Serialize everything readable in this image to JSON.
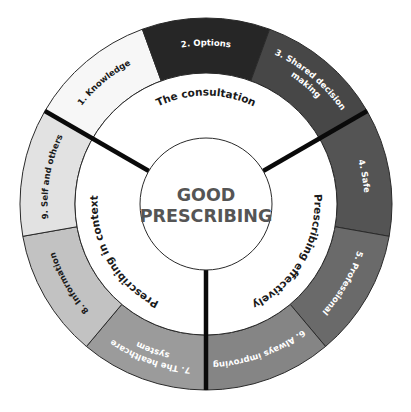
{
  "diagram": {
    "title": "GOOD PRESCRIBING",
    "center": {
      "line1": "GOOD",
      "line2": "PRESCRIBING",
      "text_color": "#555555"
    },
    "geometry": {
      "cx": 206,
      "cy": 204,
      "outer_radius": 186,
      "middle_radius": 131,
      "inner_radius": 66,
      "start_angle": -20,
      "segment_sweep": 40
    },
    "groups": [
      {
        "label": "The consultation",
        "segments": [
          1,
          2,
          3
        ],
        "start": 300,
        "end": 60
      },
      {
        "label": "Prescribing effectively",
        "segments": [
          4,
          5,
          6
        ],
        "start": 60,
        "end": 180
      },
      {
        "label": "Prescribing in context",
        "segments": [
          7,
          8,
          9
        ],
        "start": 180,
        "end": 300
      }
    ],
    "segments": [
      {
        "n": 1,
        "label": "1. Knowledge",
        "lines": [
          "1. Knowledge"
        ],
        "start": 300,
        "end": 340,
        "fill": "#f7f7f7",
        "text": "#1a1a1a"
      },
      {
        "n": 2,
        "label": "2. Options",
        "lines": [
          "2. Options"
        ],
        "start": 340,
        "end": 380,
        "fill": "#262626",
        "text": "#ffffff"
      },
      {
        "n": 3,
        "label": "3. Shared decision making",
        "lines": [
          "3. Shared decision",
          "making"
        ],
        "start": 20,
        "end": 60,
        "fill": "#474747",
        "text": "#ffffff"
      },
      {
        "n": 4,
        "label": "4. Safe",
        "lines": [
          "4. Safe"
        ],
        "start": 60,
        "end": 100,
        "fill": "#545454",
        "text": "#ffffff"
      },
      {
        "n": 5,
        "label": "5. Professional",
        "lines": [
          "5. Professional"
        ],
        "start": 100,
        "end": 140,
        "fill": "#6a6a6a",
        "text": "#ffffff"
      },
      {
        "n": 6,
        "label": "6. Always improving",
        "lines": [
          "6. Always improving"
        ],
        "start": 140,
        "end": 180,
        "fill": "#858585",
        "text": "#ffffff"
      },
      {
        "n": 7,
        "label": "7. The healthcare system",
        "lines": [
          "7. The healthcare",
          "system"
        ],
        "start": 180,
        "end": 220,
        "fill": "#9b9b9b",
        "text": "#ffffff"
      },
      {
        "n": 8,
        "label": "8. Information",
        "lines": [
          "8. Information"
        ],
        "start": 220,
        "end": 260,
        "fill": "#c2c2c2",
        "text": "#1a1a1a"
      },
      {
        "n": 9,
        "label": "9. Self and others",
        "lines": [
          "9. Self and others"
        ],
        "start": 260,
        "end": 300,
        "fill": "#e2e2e2",
        "text": "#1a1a1a"
      }
    ],
    "dividers": [
      60,
      180,
      300
    ]
  }
}
